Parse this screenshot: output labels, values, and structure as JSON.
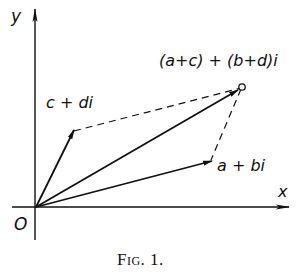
{
  "figure": {
    "caption": "Fig. 1.",
    "axes": {
      "x_label": "x",
      "y_label": "y",
      "origin_label": "O"
    },
    "vectors": [
      {
        "name": "a-plus-bi",
        "label": "a + bi",
        "style": "solid-arrow"
      },
      {
        "name": "c-plus-di",
        "label": "c + di",
        "style": "solid-arrow"
      },
      {
        "name": "sum",
        "label": "(a+c) + (b+d)i",
        "style": "solid-arrow-open-circle"
      }
    ],
    "construction": "dashed parallelogram completing vector addition",
    "colors": {
      "ink": "#111111",
      "background": "#ffffff"
    }
  }
}
